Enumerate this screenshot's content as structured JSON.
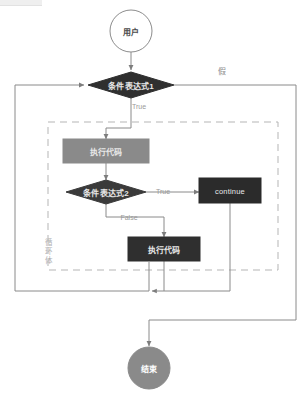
{
  "diagram": {
    "type": "flowchart",
    "nodes": [
      {
        "id": "start",
        "shape": "circle",
        "label": "用户",
        "fill": "#ffffff",
        "stroke": "#8c8c8c",
        "text_color": "#4a4a4a",
        "cx": 131,
        "cy": 31,
        "r": 21
      },
      {
        "id": "cond1",
        "shape": "diamond",
        "label": "条件表达式1",
        "fill": "#2f2f2f",
        "stroke": "#2f2f2f",
        "text_color": "#e8e8e8",
        "cx": 131,
        "cy": 85,
        "rx": 43,
        "ry": 13
      },
      {
        "id": "code1",
        "shape": "rect",
        "label": "执行代码",
        "fill": "#8a8a8a",
        "stroke": "#8a8a8a",
        "text_color": "#f2f2f2",
        "x": 63,
        "y": 139,
        "w": 86,
        "h": 24
      },
      {
        "id": "cond2",
        "shape": "diamond",
        "label": "条件表达式2",
        "fill": "#3a3a3a",
        "stroke": "#3a3a3a",
        "text_color": "#e8e8e8",
        "cx": 106,
        "cy": 192,
        "rx": 40,
        "ry": 12
      },
      {
        "id": "continue",
        "shape": "rect",
        "label": "continue",
        "fill": "#2b2b2b",
        "stroke": "#2b2b2b",
        "text_color": "#d8d8d8",
        "x": 199,
        "y": 178,
        "w": 62,
        "h": 25
      },
      {
        "id": "code2",
        "shape": "rect",
        "label": "执行代码",
        "fill": "#2f2f2f",
        "stroke": "#2f2f2f",
        "text_color": "#f0f0f0",
        "x": 128,
        "y": 237,
        "w": 72,
        "h": 24
      },
      {
        "id": "end",
        "shape": "circle",
        "label": "结束",
        "fill": "#8a8a8a",
        "stroke": "#8a8a8a",
        "text_color": "#ffffff",
        "cx": 149,
        "cy": 368,
        "r": 21
      }
    ],
    "edge_labels": [
      {
        "id": "false_cn",
        "text": "假",
        "x": 222,
        "y": 70
      },
      {
        "id": "true1",
        "text": "True",
        "x": 139,
        "y": 106
      },
      {
        "id": "true2",
        "text": "True",
        "x": 163,
        "y": 191
      },
      {
        "id": "false2",
        "text": "False",
        "x": 129,
        "y": 217
      }
    ],
    "group": {
      "id": "loop_body",
      "label": "循环体",
      "x": 44,
      "y": 238
    },
    "colors": {
      "line": "#8a8a8a",
      "dashed_group": "#b5b5b5",
      "dark_node": "#2f2f2f",
      "mid_node": "#8a8a8a",
      "page_bg": "#ffffff"
    }
  }
}
